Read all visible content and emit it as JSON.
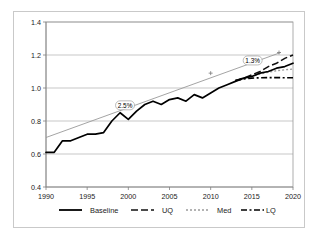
{
  "chart_data": {
    "type": "line",
    "title": "",
    "xlabel": "",
    "ylabel": "",
    "xlim": [
      1990,
      2020
    ],
    "ylim": [
      0.4,
      1.4
    ],
    "grid": true,
    "legend_position": "bottom",
    "x_ticks": [
      "1990",
      "1995",
      "2000",
      "2005",
      "2010",
      "2015",
      "2020"
    ],
    "x_tick_values": [
      1990,
      1995,
      2000,
      2005,
      2010,
      2015,
      2020
    ],
    "y_ticks": [
      "0.4",
      "0.6",
      "0.8",
      "1.0",
      "1.2",
      "1.4"
    ],
    "y_tick_values": [
      0.4,
      0.6,
      0.8,
      1.0,
      1.2,
      1.4
    ],
    "series": [
      {
        "name": "Baseline",
        "style": "solid",
        "color": "#000000",
        "x": [
          1990,
          1991,
          1992,
          1993,
          1994,
          1995,
          1996,
          1997,
          1998,
          1999,
          2000,
          2001,
          2002,
          2003,
          2004,
          2005,
          2006,
          2007,
          2008,
          2009,
          2010,
          2011,
          2012,
          2013,
          2014,
          2015,
          2016,
          2017,
          2018,
          2019,
          2020
        ],
        "values": [
          0.61,
          0.61,
          0.68,
          0.68,
          0.7,
          0.72,
          0.72,
          0.73,
          0.8,
          0.85,
          0.81,
          0.86,
          0.9,
          0.92,
          0.9,
          0.93,
          0.94,
          0.92,
          0.96,
          0.94,
          0.97,
          1.0,
          1.02,
          1.04,
          1.06,
          1.07,
          1.09,
          1.1,
          1.12,
          1.13,
          1.15
        ]
      },
      {
        "name": "UQ",
        "style": "dashed",
        "color": "#111111",
        "x": [
          2013,
          2014,
          2015,
          2016,
          2017,
          2018,
          2019,
          2020
        ],
        "values": [
          1.045,
          1.06,
          1.08,
          1.1,
          1.13,
          1.15,
          1.18,
          1.2
        ]
      },
      {
        "name": "Med",
        "style": "dotted",
        "color": "#9b9b9b",
        "x": [
          2013,
          2014,
          2015,
          2016,
          2017,
          2018,
          2019,
          2020
        ],
        "values": [
          1.045,
          1.055,
          1.07,
          1.085,
          1.095,
          1.105,
          1.11,
          1.115
        ]
      },
      {
        "name": "LQ",
        "style": "dash-dot",
        "color": "#000000",
        "x": [
          2013,
          2014,
          2015,
          2016,
          2017,
          2018,
          2019,
          2020
        ],
        "values": [
          1.045,
          1.055,
          1.06,
          1.062,
          1.063,
          1.063,
          1.062,
          1.062
        ]
      }
    ],
    "trend_lines": [
      {
        "name": "growth-trend",
        "x": [
          1990,
          2018.5
        ],
        "values": [
          0.7,
          1.215
        ],
        "color": "#9a9a9a",
        "markers": [
          {
            "x": 2010,
            "y": 1.09
          },
          {
            "x": 2018.3,
            "y": 1.215
          }
        ]
      }
    ],
    "annotations": [
      {
        "name": "annotation-2-5-percent",
        "label": "2.5%",
        "x": 1999.6,
        "y": 0.895
      },
      {
        "name": "annotation-1-3-percent",
        "label": "1.3%",
        "x": 2015.1,
        "y": 1.167
      }
    ],
    "legend": [
      {
        "label": "Baseline",
        "style": "solid"
      },
      {
        "label": "UQ",
        "style": "dashed"
      },
      {
        "label": "Med",
        "style": "dotted"
      },
      {
        "label": "LQ",
        "style": "dash-dot"
      }
    ],
    "colors": {
      "baseline": "#000000",
      "uq": "#111111",
      "med": "#9b9b9b",
      "lq": "#000000",
      "trend": "#9a9a9a",
      "gridline": "#b0b0b0",
      "frame": "#c9c9c9"
    }
  }
}
